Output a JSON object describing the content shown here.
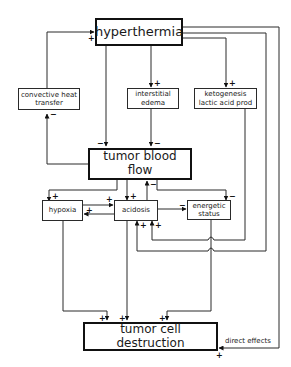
{
  "diagram": {
    "nodes": {
      "hyperthermia": {
        "label": "hyperthermia"
      },
      "convective_heat_transfer": {
        "label": "convective heat\ntransfer"
      },
      "interstitial_edema": {
        "label": "interstitial\nedema"
      },
      "ketogenesis": {
        "label": "ketogenesis\nlactic acid prod"
      },
      "tumor_blood_flow": {
        "label": "tumor blood flow"
      },
      "hypoxia": {
        "label": "hypoxia"
      },
      "acidosis": {
        "label": "acidosis"
      },
      "energetic_status": {
        "label": "energetic\nstatus"
      },
      "tumor_cell_destruction": {
        "label": "tumor cell destruction"
      }
    },
    "edges": [
      {
        "from": "convective heat transfer",
        "to": "hyperthermia",
        "sign": "+"
      },
      {
        "from": "tumor blood flow",
        "to": "convective heat transfer",
        "sign": "−"
      },
      {
        "from": "hyperthermia",
        "to": "tumor blood flow",
        "sign": "−"
      },
      {
        "from": "hyperthermia",
        "to": "interstitial edema",
        "sign": "+"
      },
      {
        "from": "interstitial edema",
        "to": "tumor blood flow",
        "sign": "−"
      },
      {
        "from": "hyperthermia",
        "to": "ketogenesis lactic acid prod",
        "sign": "+"
      },
      {
        "from": "tumor blood flow",
        "to": "hypoxia",
        "sign": "+"
      },
      {
        "from": "tumor blood flow",
        "to": "acidosis",
        "sign": "+"
      },
      {
        "from": "acidosis",
        "to": "tumor blood flow",
        "sign": "−"
      },
      {
        "from": "tumor blood flow",
        "to": "energetic status",
        "sign": "−"
      },
      {
        "from": "hypoxia",
        "to": "acidosis",
        "sign": "+"
      },
      {
        "from": "acidosis",
        "to": "hypoxia",
        "sign": "+"
      },
      {
        "from": "acidosis",
        "to": "energetic status",
        "sign": "−"
      },
      {
        "from": "ketogenesis lactic acid prod",
        "to": "acidosis",
        "sign": "+"
      },
      {
        "from": "hyperthermia",
        "to": "acidosis",
        "sign": "+"
      },
      {
        "from": "hypoxia",
        "to": "tumor cell destruction",
        "sign": "+"
      },
      {
        "from": "acidosis",
        "to": "tumor cell destruction",
        "sign": "+"
      },
      {
        "from": "energetic status",
        "to": "tumor cell destruction",
        "sign": "+"
      },
      {
        "from": "hyperthermia",
        "to": "tumor cell destruction",
        "sign": "+",
        "label": "direct effects"
      }
    ],
    "signs": {
      "plus": "+",
      "minus": "−"
    },
    "annotation": "direct effects"
  }
}
